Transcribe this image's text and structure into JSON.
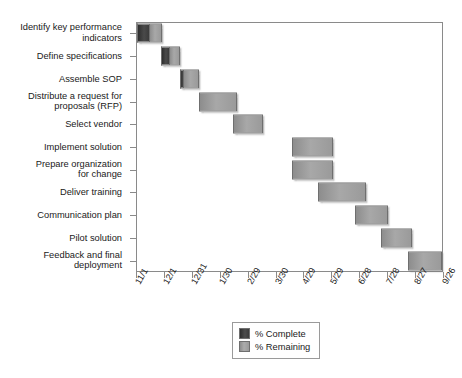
{
  "chart_data": {
    "type": "bar",
    "subtype": "gantt",
    "title": "",
    "xlabel": "",
    "ylabel": "",
    "grid": false,
    "legend_position": "bottom-center",
    "x_axis": {
      "tick_labels": [
        "11/1",
        "12/1",
        "12/31",
        "1/30",
        "2/29",
        "3/30",
        "4/29",
        "5/29",
        "6/28",
        "7/28",
        "8/27",
        "9/26"
      ],
      "range_days": [
        0,
        330
      ],
      "tick_days": [
        0,
        30,
        60,
        90,
        120,
        150,
        180,
        210,
        240,
        270,
        300,
        330
      ]
    },
    "categories": [
      "Identify key performance\nindicators",
      "Define specifications",
      "Assemble SOP",
      "Distribute a request for\nproposals (RFP)",
      "Select vendor",
      "Implement solution",
      "Prepare organization\nfor change",
      "Deliver training",
      "Communication plan",
      "Pilot solution",
      "Feedback and final\ndeployment"
    ],
    "series": [
      {
        "name": "% Complete",
        "color": "#3b3b3b"
      },
      {
        "name": "% Remaining",
        "color": "#9a9a9a"
      }
    ],
    "tasks": [
      {
        "task": "Identify key performance indicators",
        "start_day": 1,
        "end_day": 28,
        "percent_complete": 50
      },
      {
        "task": "Define specifications",
        "start_day": 27,
        "end_day": 47,
        "percent_complete": 45
      },
      {
        "task": "Assemble SOP",
        "start_day": 47,
        "end_day": 68,
        "percent_complete": 15
      },
      {
        "task": "Distribute a request for proposals (RFP)",
        "start_day": 68,
        "end_day": 109,
        "percent_complete": 0
      },
      {
        "task": "Select vendor",
        "start_day": 104,
        "end_day": 136,
        "percent_complete": 0
      },
      {
        "task": "Implement solution",
        "start_day": 168,
        "end_day": 212,
        "percent_complete": 0
      },
      {
        "task": "Prepare organization for change",
        "start_day": 168,
        "end_day": 212,
        "percent_complete": 0
      },
      {
        "task": "Deliver training",
        "start_day": 196,
        "end_day": 247,
        "percent_complete": 0
      },
      {
        "task": "Communication plan",
        "start_day": 235,
        "end_day": 271,
        "percent_complete": 0
      },
      {
        "task": "Pilot solution",
        "start_day": 263,
        "end_day": 297,
        "percent_complete": 0
      },
      {
        "task": "Feedback and final deployment",
        "start_day": 292,
        "end_day": 329,
        "percent_complete": 0
      }
    ]
  },
  "legend": {
    "items": [
      {
        "label": "% Complete",
        "swatch": "complete"
      },
      {
        "label": "% Remaining",
        "swatch": "remaining"
      }
    ]
  },
  "colors": {
    "complete": "#3b3b3b",
    "remaining": "#9a9a9a",
    "axis": "#8a8a8a",
    "text": "#1a1a1a",
    "background": "#ffffff"
  }
}
